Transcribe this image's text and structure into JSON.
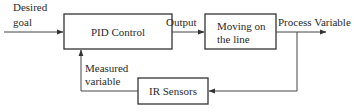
{
  "diagram": {
    "type": "block-diagram",
    "blocks": {
      "pid": {
        "label": "PID Control"
      },
      "plant": {
        "label_line1": "Moving on",
        "label_line2": "the line"
      },
      "sensor": {
        "label": "IR Sensors"
      }
    },
    "signals": {
      "input_line1": "Desired",
      "input_line2": "goal",
      "output": "Output",
      "process_variable": "Process Variable",
      "feedback_line1": "Measured",
      "feedback_line2": "variable"
    },
    "colors": {
      "stroke": "#333333",
      "text": "#2a2a2a",
      "background": "#ffffff"
    }
  }
}
